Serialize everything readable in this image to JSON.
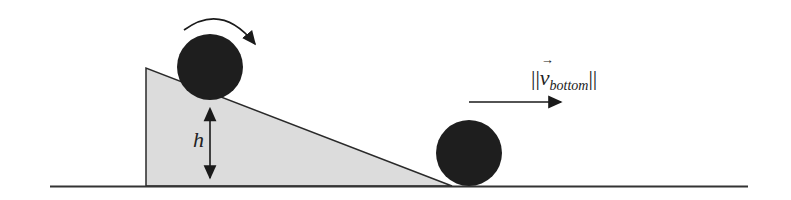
{
  "diagram": {
    "labels": {
      "height": "h",
      "velocity_bars_open": "||",
      "velocity_symbol": "v",
      "velocity_subscript": "bottom",
      "velocity_bars_close": "||"
    },
    "colors": {
      "ball": "#1e1e1e",
      "ramp_fill": "#dcdcdc",
      "line": "#2a2a2a"
    }
  }
}
